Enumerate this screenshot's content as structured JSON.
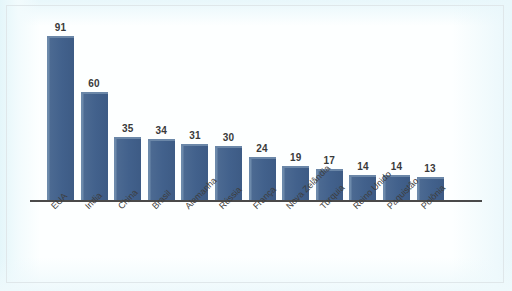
{
  "chart_data": {
    "type": "bar",
    "title": "",
    "subtitle": "",
    "xlabel": "",
    "ylabel": "",
    "ylim": [
      0,
      91
    ],
    "grid": false,
    "legend": false,
    "legend_position": "none",
    "orientation": "vertical",
    "value_labels_shown": true,
    "axis_tick_labels_y": [],
    "categories": [
      "EUA",
      "India",
      "China",
      "Brasil",
      "Alemanha",
      "Rússia",
      "França",
      "Nova Zelândia",
      "Turquia",
      "Reino Unido",
      "Paquistão",
      "Polônia"
    ],
    "values": [
      91,
      60,
      35,
      34,
      31,
      30,
      24,
      19,
      17,
      14,
      14,
      13
    ],
    "series": [
      {
        "name": "",
        "values": [
          91,
          60,
          35,
          34,
          31,
          30,
          24,
          19,
          17,
          14,
          14,
          13
        ]
      }
    ]
  },
  "style": {
    "bar_color": "#42618c",
    "bar_highlight_color": "#6d8aab",
    "axis_color": "#4a4a4a",
    "value_label_color": "#3a3a3a",
    "category_label_color": "#3d3d3d",
    "background_color": "#fdffff",
    "frame_border_color": "#dfe7ea"
  }
}
